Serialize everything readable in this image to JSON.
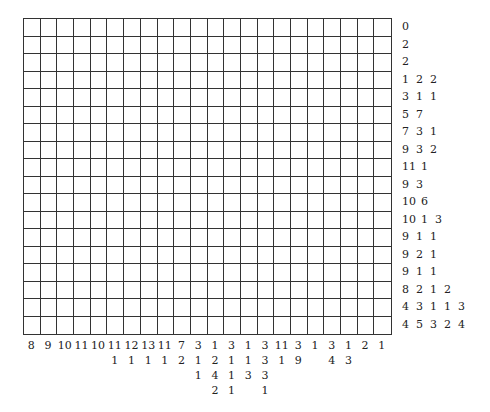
{
  "puzzle": {
    "type": "nonogram",
    "columns": 22,
    "rows": 18,
    "row_clues": [
      [
        0
      ],
      [
        2
      ],
      [
        2
      ],
      [
        1,
        2,
        2
      ],
      [
        3,
        1,
        1
      ],
      [
        5,
        7
      ],
      [
        7,
        3,
        1
      ],
      [
        9,
        3,
        2
      ],
      [
        11,
        1
      ],
      [
        9,
        3
      ],
      [
        10,
        6
      ],
      [
        10,
        1,
        3
      ],
      [
        9,
        1,
        1
      ],
      [
        9,
        2,
        1
      ],
      [
        9,
        1,
        1
      ],
      [
        8,
        2,
        1,
        2
      ],
      [
        4,
        3,
        1,
        1,
        3
      ],
      [
        4,
        5,
        3,
        2,
        4
      ]
    ],
    "col_clues": [
      [
        8
      ],
      [
        9
      ],
      [
        10
      ],
      [
        11
      ],
      [
        10
      ],
      [
        11,
        1
      ],
      [
        12,
        1
      ],
      [
        13,
        1
      ],
      [
        11,
        1
      ],
      [
        7,
        2
      ],
      [
        3,
        1,
        1
      ],
      [
        1,
        2,
        4,
        2
      ],
      [
        3,
        1,
        1,
        1
      ],
      [
        1,
        1,
        3
      ],
      [
        3,
        3,
        3,
        1
      ],
      [
        11,
        1
      ],
      [
        3,
        9
      ],
      [
        1
      ],
      [
        3,
        4
      ],
      [
        1,
        3
      ],
      [
        2
      ],
      [
        1
      ]
    ]
  },
  "colors": {
    "grid_line": "#333333",
    "background": "#ffffff",
    "text": "#222222"
  }
}
